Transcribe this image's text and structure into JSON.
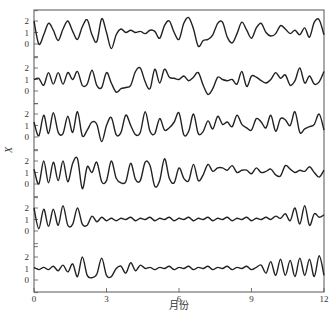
{
  "chart_data": {
    "type": "line",
    "title": "",
    "xlabel": "月份",
    "ylabel": "X",
    "xlim": [
      0,
      12
    ],
    "x_ticks": [
      "0",
      "3",
      "6",
      "9",
      "12"
    ],
    "panel_y_ticks": [
      "2",
      "1",
      "0"
    ],
    "panel_ylim": [
      -0.6,
      2.6
    ],
    "grid": false,
    "legend": null,
    "panels": 6,
    "series": [
      {
        "name": "panel-1",
        "x": [
          0,
          0.2,
          0.4,
          0.6,
          0.8,
          1.0,
          1.2,
          1.4,
          1.6,
          1.8,
          2.0,
          2.2,
          2.4,
          2.6,
          2.8,
          3.0,
          3.2,
          3.4,
          3.6,
          3.8,
          4.0,
          4.2,
          4.4,
          4.6,
          4.8,
          5.0,
          5.2,
          5.4,
          5.6,
          5.8,
          6.0,
          6.2,
          6.4,
          6.6,
          6.8,
          7.0,
          7.2,
          7.4,
          7.6,
          7.8,
          8.0,
          8.2,
          8.4,
          8.6,
          8.8,
          9.0,
          9.2,
          9.4,
          9.6,
          9.8,
          10.0,
          10.2,
          10.4,
          10.6,
          10.8,
          11.0,
          11.2,
          11.4,
          11.6,
          11.8,
          12.0
        ],
        "values": [
          2.0,
          0.0,
          0.8,
          1.8,
          1.2,
          0.3,
          1.3,
          2.0,
          1.1,
          0.4,
          1.5,
          2.1,
          0.8,
          0.2,
          2.2,
          1.0,
          -0.4,
          0.8,
          1.3,
          1.0,
          1.2,
          1.0,
          1.1,
          0.9,
          1.2,
          1.1,
          0.5,
          1.6,
          2.0,
          1.0,
          0.4,
          1.8,
          2.3,
          1.3,
          -0.2,
          0.3,
          0.4,
          0.8,
          1.8,
          1.9,
          0.6,
          0.1,
          0.9,
          1.9,
          1.2,
          0.5,
          1.4,
          1.8,
          1.0,
          0.7,
          0.9,
          1.6,
          1.3,
          0.9,
          1.2,
          0.8,
          1.4,
          0.6,
          1.9,
          2.1,
          0.8
        ]
      },
      {
        "name": "panel-2",
        "x": [
          0,
          0.2,
          0.4,
          0.6,
          0.8,
          1.0,
          1.2,
          1.4,
          1.6,
          1.8,
          2.0,
          2.2,
          2.4,
          2.6,
          2.8,
          3.0,
          3.2,
          3.4,
          3.6,
          3.8,
          4.0,
          4.2,
          4.4,
          4.6,
          4.8,
          5.0,
          5.2,
          5.4,
          5.6,
          5.8,
          6.0,
          6.2,
          6.4,
          6.6,
          6.8,
          7.0,
          7.2,
          7.4,
          7.6,
          7.8,
          8.0,
          8.2,
          8.4,
          8.6,
          8.8,
          9.0,
          9.2,
          9.4,
          9.6,
          9.8,
          10.0,
          10.2,
          10.4,
          10.6,
          10.8,
          11.0,
          11.2,
          11.4,
          11.6,
          11.8,
          12.0
        ],
        "values": [
          1.0,
          1.1,
          0.5,
          1.6,
          0.6,
          1.6,
          0.6,
          1.6,
          1.0,
          1.7,
          0.5,
          0.6,
          1.8,
          0.5,
          0.3,
          1.6,
          0.7,
          -0.1,
          0.2,
          0.3,
          0.5,
          1.7,
          2.0,
          0.8,
          0.2,
          1.9,
          0.7,
          1.9,
          1.2,
          1.1,
          1.0,
          1.3,
          0.9,
          1.2,
          1.6,
          0.5,
          -0.3,
          0.2,
          1.2,
          1.0,
          0.9,
          1.0,
          0.6,
          1.7,
          0.4,
          1.3,
          1.2,
          0.9,
          0.7,
          1.0,
          1.6,
          1.1,
          1.4,
          0.5,
          0.9,
          2.0,
          0.7,
          1.3,
          0.6,
          0.8,
          1.7
        ]
      },
      {
        "name": "panel-3",
        "x": [
          0,
          0.2,
          0.4,
          0.6,
          0.8,
          1.0,
          1.2,
          1.4,
          1.6,
          1.8,
          2.0,
          2.2,
          2.4,
          2.6,
          2.8,
          3.0,
          3.2,
          3.4,
          3.6,
          3.8,
          4.0,
          4.2,
          4.4,
          4.6,
          4.8,
          5.0,
          5.2,
          5.4,
          5.6,
          5.8,
          6.0,
          6.2,
          6.4,
          6.6,
          6.8,
          7.0,
          7.2,
          7.4,
          7.6,
          7.8,
          8.0,
          8.2,
          8.4,
          8.6,
          8.8,
          9.0,
          9.2,
          9.4,
          9.6,
          9.8,
          10.0,
          10.2,
          10.4,
          10.6,
          10.8,
          11.0,
          11.2,
          11.4,
          11.6,
          11.8,
          12.0
        ],
        "values": [
          1.3,
          0.1,
          1.9,
          0.3,
          2.1,
          0.4,
          0.3,
          1.8,
          0.4,
          2.2,
          0.1,
          0.6,
          1.3,
          1.1,
          -0.4,
          1.0,
          1.7,
          0.2,
          0.4,
          1.9,
          1.0,
          0.2,
          0.4,
          2.2,
          0.5,
          0.3,
          1.6,
          0.6,
          0.8,
          1.3,
          2.1,
          0.2,
          0.5,
          2.0,
          0.3,
          0.5,
          1.4,
          0.7,
          1.8,
          1.1,
          1.3,
          0.9,
          1.9,
          1.1,
          0.8,
          0.6,
          1.6,
          1.3,
          0.8,
          1.9,
          0.5,
          1.6,
          1.5,
          1.0,
          2.2,
          0.4,
          0.7,
          0.9,
          1.1,
          2.0,
          0.6
        ]
      },
      {
        "name": "panel-4",
        "x": [
          0,
          0.2,
          0.4,
          0.6,
          0.8,
          1.0,
          1.2,
          1.4,
          1.6,
          1.8,
          2.0,
          2.2,
          2.4,
          2.6,
          2.8,
          3.0,
          3.2,
          3.4,
          3.6,
          3.8,
          4.0,
          4.2,
          4.4,
          4.6,
          4.8,
          5.0,
          5.2,
          5.4,
          5.6,
          5.8,
          6.0,
          6.2,
          6.4,
          6.6,
          6.8,
          7.0,
          7.2,
          7.4,
          7.6,
          7.8,
          8.0,
          8.2,
          8.4,
          8.6,
          8.8,
          9.0,
          9.2,
          9.4,
          9.6,
          9.8,
          10.0,
          10.2,
          10.4,
          10.6,
          10.8,
          11.0,
          11.2,
          11.4,
          11.6,
          11.8,
          12.0
        ],
        "values": [
          1.3,
          0.0,
          2.0,
          0.1,
          1.9,
          0.3,
          2.0,
          0.2,
          1.8,
          2.2,
          -0.4,
          1.5,
          1.0,
          1.9,
          0.2,
          0.3,
          2.0,
          0.5,
          0.1,
          0.2,
          1.8,
          0.4,
          0.3,
          1.9,
          1.6,
          -0.2,
          0.3,
          2.2,
          0.5,
          0.1,
          1.4,
          0.5,
          0.3,
          1.7,
          0.3,
          0.8,
          1.7,
          1.1,
          1.4,
          1.4,
          1.2,
          1.6,
          1.0,
          1.2,
          1.2,
          0.9,
          1.4,
          1.0,
          1.1,
          1.3,
          0.8,
          0.7,
          1.6,
          1.3,
          1.0,
          1.2,
          1.1,
          1.5,
          1.0,
          0.6,
          1.2
        ]
      },
      {
        "name": "panel-5",
        "x": [
          0,
          0.2,
          0.4,
          0.6,
          0.8,
          1.0,
          1.2,
          1.4,
          1.6,
          1.8,
          2.0,
          2.2,
          2.4,
          2.6,
          2.8,
          3.0,
          3.2,
          3.4,
          3.6,
          3.8,
          4.0,
          4.2,
          4.4,
          4.6,
          4.8,
          5.0,
          5.2,
          5.4,
          5.6,
          5.8,
          6.0,
          6.2,
          6.4,
          6.6,
          6.8,
          7.0,
          7.2,
          7.4,
          7.6,
          7.8,
          8.0,
          8.2,
          8.4,
          8.6,
          8.8,
          9.0,
          9.2,
          9.4,
          9.6,
          9.8,
          10.0,
          10.2,
          10.4,
          10.6,
          10.8,
          11.0,
          11.2,
          11.4,
          11.6,
          11.8,
          12.0
        ],
        "values": [
          2.0,
          0.2,
          1.9,
          0.4,
          1.9,
          0.5,
          2.2,
          0.5,
          0.6,
          2.0,
          0.6,
          0.5,
          1.3,
          0.8,
          1.2,
          0.9,
          1.1,
          0.9,
          1.1,
          1.0,
          1.2,
          0.9,
          1.1,
          1.0,
          1.2,
          0.9,
          1.1,
          1.0,
          1.2,
          0.9,
          1.1,
          1.0,
          1.2,
          0.9,
          1.1,
          1.0,
          1.2,
          0.9,
          1.1,
          1.0,
          1.2,
          0.9,
          1.1,
          1.0,
          1.2,
          0.9,
          1.1,
          1.0,
          1.2,
          1.0,
          1.3,
          1.1,
          1.5,
          0.9,
          2.0,
          0.6,
          2.2,
          0.5,
          1.5,
          1.2,
          1.4
        ]
      },
      {
        "name": "panel-6",
        "x": [
          0,
          0.2,
          0.4,
          0.6,
          0.8,
          1.0,
          1.2,
          1.4,
          1.6,
          1.8,
          2.0,
          2.2,
          2.4,
          2.6,
          2.8,
          3.0,
          3.2,
          3.4,
          3.6,
          3.8,
          4.0,
          4.2,
          4.4,
          4.6,
          4.8,
          5.0,
          5.2,
          5.4,
          5.6,
          5.8,
          6.0,
          6.2,
          6.4,
          6.6,
          6.8,
          7.0,
          7.2,
          7.4,
          7.6,
          7.8,
          8.0,
          8.2,
          8.4,
          8.6,
          8.8,
          9.0,
          9.2,
          9.4,
          9.6,
          9.8,
          10.0,
          10.2,
          10.4,
          10.6,
          10.8,
          11.0,
          11.2,
          11.4,
          11.6,
          11.8,
          12.0
        ],
        "values": [
          1.1,
          0.9,
          1.1,
          0.9,
          1.2,
          0.8,
          1.3,
          0.7,
          1.4,
          0.3,
          2.0,
          0.4,
          0.2,
          0.5,
          1.9,
          0.4,
          0.3,
          1.0,
          1.2,
          0.6,
          1.5,
          0.8,
          1.3,
          1.0,
          1.1,
          0.9,
          1.1,
          1.0,
          1.2,
          0.9,
          1.1,
          1.0,
          1.2,
          0.9,
          1.1,
          1.0,
          1.2,
          0.9,
          1.1,
          1.0,
          1.2,
          0.9,
          1.1,
          1.0,
          1.2,
          0.9,
          1.1,
          1.3,
          0.6,
          1.6,
          0.4,
          1.8,
          0.4,
          1.7,
          0.3,
          1.9,
          0.4,
          1.8,
          0.3,
          2.1,
          0.4
        ]
      }
    ]
  },
  "axes": {
    "x_tick_labels": [
      "0",
      "3",
      "6",
      "9",
      "12"
    ],
    "y_tick_labels": [
      "2",
      "1",
      "0"
    ],
    "xlabel": "月份",
    "ylabel": "X"
  },
  "colors": {
    "line": "#222222",
    "axis": "#555555",
    "text": "#333333"
  }
}
